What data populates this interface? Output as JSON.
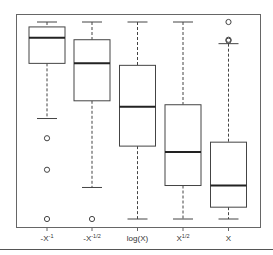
{
  "chart_data": {
    "type": "box",
    "title": "",
    "xlabel": "",
    "ylabel": "",
    "y_axis_shown": false,
    "grid": false,
    "ylim": [
      0,
      1
    ],
    "categories": [
      "-X^-1",
      "-X^-1/2",
      "log(X)",
      "X^1/2",
      "X"
    ],
    "tick_labels": [
      {
        "base": "-X",
        "sup": "-1"
      },
      {
        "base": "-X",
        "sup": "-1/2"
      },
      {
        "base": "log(X)",
        "sup": ""
      },
      {
        "base": "X",
        "sup": "1/2"
      },
      {
        "base": "X",
        "sup": ""
      }
    ],
    "boxes": [
      {
        "name": "-X^-1",
        "whisker_low": 0.51,
        "q1": 0.79,
        "median": 0.92,
        "q3": 0.975,
        "whisker_high": 1.0,
        "outliers": [
          0.41,
          0.25,
          0.0
        ]
      },
      {
        "name": "-X^-1/2",
        "whisker_low": 0.16,
        "q1": 0.6,
        "median": 0.79,
        "q3": 0.91,
        "whisker_high": 1.0,
        "outliers": [
          0.0
        ]
      },
      {
        "name": "log(X)",
        "whisker_low": 0.0,
        "q1": 0.37,
        "median": 0.57,
        "q3": 0.78,
        "whisker_high": 1.0,
        "outliers": []
      },
      {
        "name": "X^1/2",
        "whisker_low": 0.0,
        "q1": 0.17,
        "median": 0.34,
        "q3": 0.58,
        "whisker_high": 1.0,
        "outliers": []
      },
      {
        "name": "X",
        "whisker_low": 0.0,
        "q1": 0.06,
        "median": 0.17,
        "q3": 0.39,
        "whisker_high": 0.89,
        "outliers": [
          1.0,
          0.91,
          0.905
        ]
      }
    ]
  },
  "colors": {
    "line": "#444444",
    "median": "#222222",
    "frame": "#666666",
    "background": "#ffffff"
  }
}
